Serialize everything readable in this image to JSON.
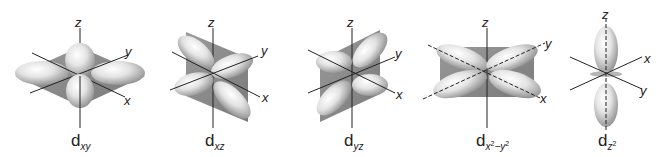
{
  "figure": {
    "colors": {
      "plane": "#8a8a8a",
      "lobe_light": "#f2f2f2",
      "lobe_dark": "#9a9a9a",
      "axis": "#222222"
    },
    "orbitals": [
      {
        "id": "dxy",
        "base": "d",
        "subscript": "xy",
        "sup": "",
        "sub2": "",
        "axes": {
          "z": "z",
          "y": "y",
          "x": "x"
        }
      },
      {
        "id": "dxz",
        "base": "d",
        "subscript": "xz",
        "sup": "",
        "sub2": "",
        "axes": {
          "z": "z",
          "y": "y",
          "x": "x"
        }
      },
      {
        "id": "dyz",
        "base": "d",
        "subscript": "yz",
        "sup": "",
        "sub2": "",
        "axes": {
          "z": "z",
          "y": "y",
          "x": "x"
        }
      },
      {
        "id": "dx2y2",
        "base": "d",
        "subscript": "x",
        "sup": "2",
        "sub2": "−y",
        "sup2": "2",
        "axes": {
          "z": "z",
          "y": "y",
          "x": "x"
        }
      },
      {
        "id": "dz2",
        "base": "d",
        "subscript": "z",
        "sup": "2",
        "sub2": "",
        "axes": {
          "z": "z",
          "x": "x",
          "y": "y"
        }
      }
    ]
  }
}
